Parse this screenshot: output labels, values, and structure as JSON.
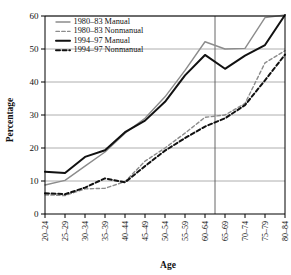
{
  "chart_data": {
    "type": "line",
    "title": "",
    "xlabel": "Age",
    "ylabel": "Percentage",
    "ylim": [
      0,
      60
    ],
    "yticks": [
      0,
      10,
      20,
      30,
      40,
      50,
      60
    ],
    "grid": true,
    "legend_position": "top-left",
    "categories": [
      "20–24",
      "25–29",
      "30–34",
      "35–39",
      "40–44",
      "45–49",
      "50–54",
      "55–59",
      "60–64",
      "65–69",
      "70–74",
      "75–79",
      "80–84"
    ],
    "annotations": [
      {
        "name": "retirement-reference-line",
        "type": "vline",
        "between": [
          "60–64",
          "65–69"
        ]
      }
    ],
    "series": [
      {
        "name": "1980–83 Manual",
        "style": "solid",
        "color": "#8c8c8c",
        "width": 1.4,
        "values": [
          8.8,
          10.2,
          14.5,
          18.8,
          24.5,
          29.0,
          35.5,
          43.5,
          52.2,
          50.0,
          50.2,
          59.5,
          60.3
        ]
      },
      {
        "name": "1980–83 Nonmanual",
        "style": "dashed",
        "color": "#8c8c8c",
        "width": 1.4,
        "values": [
          5.8,
          5.6,
          7.6,
          7.8,
          9.8,
          16.0,
          20.0,
          24.5,
          29.3,
          30.0,
          33.5,
          45.8,
          49.5
        ]
      },
      {
        "name": "1994–97 Manual",
        "style": "solid",
        "color": "#111111",
        "width": 2.0,
        "values": [
          12.8,
          12.4,
          17.3,
          19.3,
          24.8,
          28.3,
          34.0,
          42.0,
          48.2,
          44.0,
          48.0,
          51.2,
          60.3
        ]
      },
      {
        "name": "1994–97 Nonmanual",
        "style": "dashed",
        "color": "#111111",
        "width": 2.0,
        "values": [
          6.3,
          6.0,
          8.0,
          10.8,
          9.6,
          14.5,
          19.2,
          23.0,
          26.5,
          29.0,
          33.0,
          40.5,
          48.3
        ]
      }
    ]
  },
  "legend": {
    "items": [
      {
        "label": "1980–83 Manual"
      },
      {
        "label": "1980–83 Nonmanual"
      },
      {
        "label": "1994–97 Manual"
      },
      {
        "label": "1994–97 Nonmanual"
      }
    ]
  }
}
